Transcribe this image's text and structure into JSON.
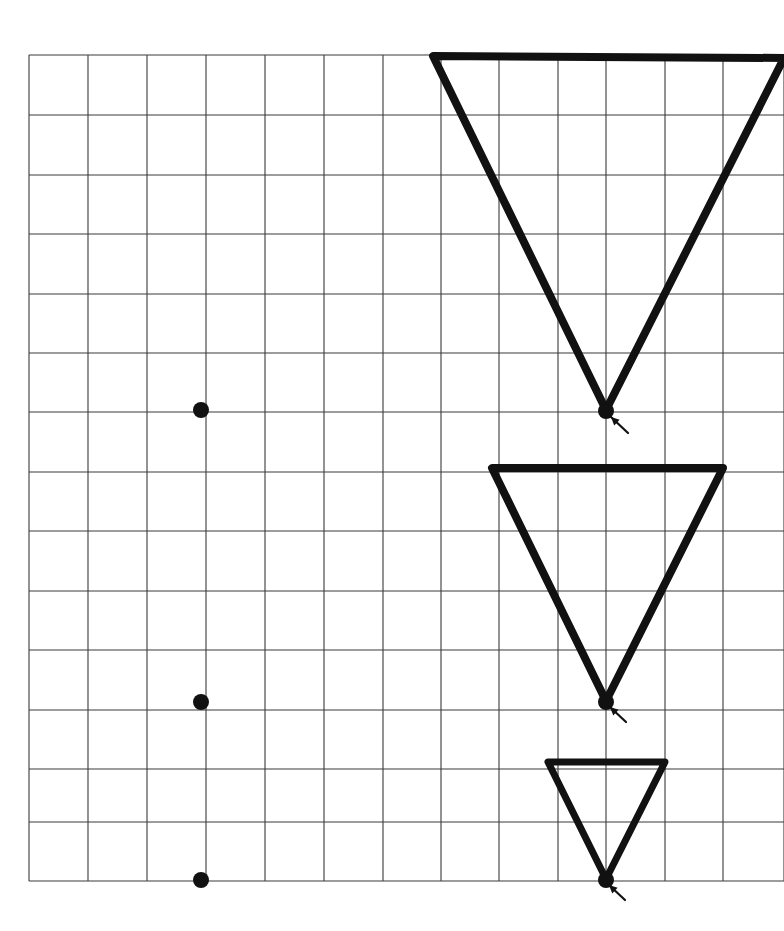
{
  "figure": {
    "background_color": "#ffffff",
    "width": 784,
    "height": 931
  },
  "grid": {
    "name": "graph-paper-grid",
    "line_color": "#3a3a3a",
    "line_width": 1.1,
    "cell_size": 59,
    "origin_x": 29,
    "origin_y": 55,
    "columns": 13,
    "rows": 14,
    "x_lines": [
      29,
      88,
      147,
      206,
      265,
      324,
      383,
      441,
      499,
      558,
      606,
      665,
      723,
      784
    ],
    "y_lines": [
      55,
      115,
      175,
      234,
      294,
      353,
      412,
      472,
      531,
      591,
      650,
      710,
      769,
      822,
      881
    ],
    "clipped_right_edge": true
  },
  "shapes": {
    "stroke_color": "#111111",
    "triangles": [
      {
        "name": "large-inverted-triangle",
        "label": "Triangle 1 (largest)",
        "stroke_width": 8,
        "top_left": [
          433,
          56
        ],
        "top_right": [
          784,
          58
        ],
        "apex": [
          606,
          410
        ],
        "base_width_cells": 6,
        "height_cells": 6
      },
      {
        "name": "medium-inverted-triangle",
        "label": "Triangle 2 (medium)",
        "stroke_width": 8,
        "top_left": [
          492,
          468
        ],
        "top_right": [
          723,
          468
        ],
        "apex": [
          606,
          701
        ],
        "base_width_cells": 4,
        "height_cells": 4
      },
      {
        "name": "small-inverted-triangle",
        "label": "Triangle 3 (smallest)",
        "stroke_width": 7,
        "top_left": [
          548,
          762
        ],
        "top_right": [
          665,
          762
        ],
        "apex": [
          606,
          879
        ],
        "base_width_cells": 2,
        "height_cells": 2
      }
    ],
    "apex_markers": [
      {
        "name": "apex-dot-large",
        "cx": 606,
        "cy": 411,
        "r": 8
      },
      {
        "name": "apex-dot-medium",
        "cx": 606,
        "cy": 702,
        "r": 8
      },
      {
        "name": "apex-dot-small",
        "cx": 606,
        "cy": 880,
        "r": 8
      }
    ],
    "arrows": [
      {
        "name": "apex-arrow-large",
        "tail": [
          628,
          433
        ],
        "head": [
          611,
          417
        ]
      },
      {
        "name": "apex-arrow-medium",
        "tail": [
          626,
          722
        ],
        "head": [
          610,
          707
        ]
      },
      {
        "name": "apex-arrow-small",
        "tail": [
          625,
          900
        ],
        "head": [
          609,
          885
        ]
      }
    ],
    "left_dots": [
      {
        "name": "left-dot-upper",
        "cx": 201,
        "cy": 410,
        "r": 8
      },
      {
        "name": "left-dot-middle",
        "cx": 201,
        "cy": 702,
        "r": 8
      },
      {
        "name": "left-dot-lower",
        "cx": 201,
        "cy": 880,
        "r": 8
      }
    ]
  }
}
